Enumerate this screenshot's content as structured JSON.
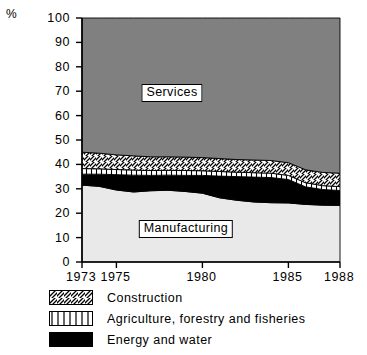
{
  "axis": {
    "unit_label": "%",
    "y_ticks": [
      "100",
      "90",
      "80",
      "70",
      "60",
      "50",
      "40",
      "30",
      "20",
      "10",
      "0"
    ],
    "y_values": [
      100,
      90,
      80,
      70,
      60,
      50,
      40,
      30,
      20,
      10,
      0
    ],
    "x_ticks": [
      "1973",
      "1975",
      "1980",
      "1985",
      "1988"
    ],
    "x_values": [
      1973,
      1975,
      1980,
      1985,
      1988
    ]
  },
  "plot_labels": {
    "services": "Services",
    "manufacturing": "Manufacturing"
  },
  "legend": {
    "items": [
      {
        "label": "Construction",
        "pattern": "diagonal-hatch",
        "color": "#ffffff"
      },
      {
        "label": "Agriculture, forestry and fisheries",
        "pattern": "vertical-stripe",
        "color": "#ffffff"
      },
      {
        "label": "Energy and water",
        "pattern": "solid",
        "color": "#000000"
      }
    ]
  },
  "colors": {
    "services": "#808080",
    "manufacturing": "#e9e9e9",
    "energy_and_water": "#000000",
    "agriculture": "#ffffff",
    "construction": "#ffffff",
    "axis": "#000000",
    "background": "#ffffff"
  },
  "chart_data": {
    "type": "area",
    "title": "",
    "subtitle": "",
    "xlabel": "",
    "ylabel": "%",
    "xlim": [
      1973,
      1988
    ],
    "ylim": [
      0,
      100
    ],
    "grid": false,
    "legend_position": "below",
    "stacking": "bottom-to-top: Manufacturing, Energy and water, Agriculture forestry and fisheries, Construction, Services",
    "x": [
      1973,
      1974,
      1975,
      1976,
      1977,
      1978,
      1979,
      1980,
      1981,
      1982,
      1983,
      1984,
      1985,
      1986,
      1987,
      1988
    ],
    "series": [
      {
        "name": "Manufacturing",
        "pattern": "solid-light",
        "values": [
          31.5,
          31.0,
          29.5,
          28.7,
          29.2,
          29.4,
          28.9,
          28.2,
          26.3,
          25.3,
          24.6,
          24.3,
          24.2,
          23.6,
          23.3,
          23.2
        ]
      },
      {
        "name": "Energy and water",
        "pattern": "solid-black",
        "values": [
          4.5,
          5.0,
          6.3,
          6.9,
          6.3,
          6.2,
          6.6,
          7.3,
          8.9,
          9.7,
          10.2,
          10.3,
          9.6,
          7.2,
          6.4,
          6.1
        ]
      },
      {
        "name": "Agriculture, forestry and fisheries",
        "pattern": "vertical-stripe",
        "values": [
          2.3,
          2.2,
          2.1,
          2.1,
          2.0,
          2.0,
          2.0,
          1.9,
          1.9,
          1.8,
          1.8,
          1.8,
          1.7,
          1.7,
          1.6,
          1.6
        ]
      },
      {
        "name": "Construction",
        "pattern": "diagonal-hatch",
        "values": [
          6.7,
          6.4,
          6.0,
          5.8,
          5.6,
          5.5,
          5.5,
          5.4,
          5.3,
          5.2,
          5.2,
          5.2,
          5.2,
          5.3,
          5.4,
          5.5
        ]
      },
      {
        "name": "Services",
        "pattern": "solid-gray",
        "values": [
          55.0,
          55.4,
          56.1,
          56.5,
          56.9,
          56.9,
          57.0,
          57.2,
          57.6,
          58.0,
          58.2,
          58.4,
          59.3,
          62.2,
          63.3,
          63.6
        ]
      }
    ],
    "cumulative_tops": {
      "manufacturing": [
        31.5,
        31.0,
        29.5,
        28.7,
        29.2,
        29.4,
        28.9,
        28.2,
        26.3,
        25.3,
        24.6,
        24.3,
        24.2,
        23.6,
        23.3,
        23.2
      ],
      "energy_and_water": [
        36.0,
        36.0,
        35.8,
        35.6,
        35.5,
        35.6,
        35.5,
        35.5,
        35.2,
        35.0,
        34.8,
        34.6,
        33.8,
        30.8,
        29.7,
        29.3
      ],
      "agriculture": [
        38.3,
        38.2,
        37.9,
        37.7,
        37.5,
        37.6,
        37.5,
        37.4,
        37.1,
        36.8,
        36.6,
        36.4,
        35.5,
        32.5,
        31.3,
        30.9
      ],
      "construction": [
        45.0,
        44.6,
        43.9,
        43.5,
        43.1,
        43.1,
        43.0,
        42.8,
        42.4,
        42.0,
        41.8,
        41.6,
        40.7,
        37.8,
        36.7,
        36.4
      ],
      "services": [
        100,
        100,
        100,
        100,
        100,
        100,
        100,
        100,
        100,
        100,
        100,
        100,
        100,
        100,
        100,
        100
      ]
    }
  }
}
